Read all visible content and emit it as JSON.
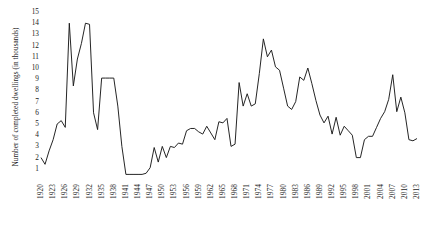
{
  "chart_data": {
    "type": "line",
    "title": "",
    "xlabel": "",
    "ylabel": "Number of completed dwellings (in thousands)",
    "ylim": [
      0,
      15
    ],
    "xlim": [
      1920,
      2013
    ],
    "grid": false,
    "legend": null,
    "y_ticks": [
      1,
      2,
      3,
      4,
      5,
      6,
      7,
      8,
      9,
      10,
      11,
      12,
      13,
      14,
      15
    ],
    "x_ticks": [
      "1920",
      "1923",
      "1926",
      "1929",
      "1932",
      "1935",
      "1938",
      "1941",
      "1944",
      "1947",
      "1950",
      "1953",
      "1956",
      "1959",
      "1962",
      "1965",
      "1968",
      "1971",
      "1974",
      "1977",
      "1980",
      "1983",
      "1986",
      "1989",
      "1992",
      "1995",
      "1998",
      "2001",
      "2004",
      "2007",
      "2010",
      "2013"
    ],
    "x": [
      1920,
      1921,
      1922,
      1923,
      1924,
      1925,
      1926,
      1927,
      1928,
      1929,
      1930,
      1931,
      1932,
      1933,
      1934,
      1935,
      1936,
      1937,
      1938,
      1939,
      1940,
      1941,
      1942,
      1943,
      1944,
      1945,
      1946,
      1947,
      1948,
      1949,
      1950,
      1951,
      1952,
      1953,
      1954,
      1955,
      1956,
      1957,
      1958,
      1959,
      1960,
      1961,
      1962,
      1963,
      1964,
      1965,
      1966,
      1967,
      1968,
      1969,
      1970,
      1971,
      1972,
      1973,
      1974,
      1975,
      1976,
      1977,
      1978,
      1979,
      1980,
      1981,
      1982,
      1983,
      1984,
      1985,
      1986,
      1987,
      1988,
      1989,
      1990,
      1991,
      1992,
      1993,
      1994,
      1995,
      1996,
      1997,
      1998,
      1999,
      2000,
      2001,
      2002,
      2003,
      2004,
      2005,
      2006,
      2007,
      2008,
      2009,
      2010,
      2011,
      2012,
      2013
    ],
    "values": [
      2.0,
      1.4,
      2.6,
      3.6,
      5.0,
      5.3,
      4.7,
      14.0,
      8.4,
      10.8,
      12.2,
      14.0,
      13.9,
      6.0,
      4.5,
      9.1,
      9.1,
      9.1,
      9.1,
      6.6,
      3.0,
      0.5,
      0.5,
      0.5,
      0.5,
      0.5,
      0.6,
      1.1,
      2.9,
      1.6,
      3.0,
      2.0,
      3.0,
      2.9,
      3.3,
      3.2,
      4.4,
      4.6,
      4.6,
      4.3,
      4.1,
      4.8,
      4.2,
      3.6,
      5.2,
      5.1,
      5.5,
      3.0,
      3.2,
      8.7,
      6.6,
      7.7,
      6.6,
      6.8,
      9.5,
      12.6,
      11.0,
      11.6,
      10.1,
      9.8,
      8.2,
      6.6,
      6.3,
      7.0,
      9.2,
      8.9,
      10.0,
      8.6,
      7.1,
      5.8,
      5.1,
      5.7,
      4.1,
      5.6,
      4.0,
      4.8,
      4.4,
      4.0,
      2.0,
      2.0,
      3.6,
      3.9,
      3.9,
      4.7,
      5.5,
      6.1,
      7.2,
      9.4,
      6.1,
      7.4,
      6.0,
      3.6,
      3.5,
      3.7
    ]
  }
}
